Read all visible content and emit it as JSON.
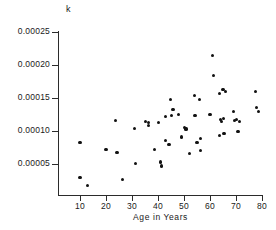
{
  "chart_data": {
    "type": "scatter",
    "title": "",
    "xlabel": "Age in Years",
    "ylabel": "k",
    "xlim": [
      0,
      82
    ],
    "ylim": [
      0,
      0.00025
    ],
    "grid": false,
    "legend": null,
    "xticks": [
      10,
      20,
      30,
      40,
      50,
      60,
      70,
      80
    ],
    "xtick_labels": [
      "10",
      "20",
      "30",
      "40",
      "50",
      "60",
      "70",
      "80"
    ],
    "yticks": [
      5e-05,
      0.0001,
      0.00015,
      0.0002,
      0.00025
    ],
    "ytick_labels": [
      "0.00005",
      "0.00010",
      "0.00015",
      "0.00020",
      "0.00025"
    ],
    "marker": "filled-circle",
    "marker_color": "#111111",
    "points": [
      {
        "x": 10.0,
        "y": 8.2e-05
      },
      {
        "x": 10.0,
        "y": 2.9e-05
      },
      {
        "x": 12.8,
        "y": 1.8e-05
      },
      {
        "x": 20.0,
        "y": 7.2e-05
      },
      {
        "x": 23.8,
        "y": 0.000116
      },
      {
        "x": 24.2,
        "y": 6.8e-05
      },
      {
        "x": 26.5,
        "y": 2.6e-05
      },
      {
        "x": 31.0,
        "y": 0.000104
      },
      {
        "x": 31.2,
        "y": 5.1e-05
      },
      {
        "x": 35.2,
        "y": 0.000114
      },
      {
        "x": 36.2,
        "y": 0.000113
      },
      {
        "x": 36.4,
        "y": 0.000108
      },
      {
        "x": 38.8,
        "y": 7.2e-05
      },
      {
        "x": 40.2,
        "y": 0.000113
      },
      {
        "x": 41.0,
        "y": 5.3e-05
      },
      {
        "x": 41.2,
        "y": 4.7e-05
      },
      {
        "x": 42.8,
        "y": 8.6e-05
      },
      {
        "x": 43.0,
        "y": 0.000122
      },
      {
        "x": 44.2,
        "y": 7.9e-05
      },
      {
        "x": 44.8,
        "y": 0.000148
      },
      {
        "x": 45.2,
        "y": 0.000123
      },
      {
        "x": 45.8,
        "y": 0.000133
      },
      {
        "x": 47.8,
        "y": 0.000125
      },
      {
        "x": 49.0,
        "y": 9.1e-05
      },
      {
        "x": 50.2,
        "y": 0.000105
      },
      {
        "x": 50.8,
        "y": 0.000103
      },
      {
        "x": 52.0,
        "y": 6.6e-05
      },
      {
        "x": 54.0,
        "y": 0.000154
      },
      {
        "x": 54.2,
        "y": 0.000123
      },
      {
        "x": 55.0,
        "y": 8.2e-05
      },
      {
        "x": 56.0,
        "y": 0.000148
      },
      {
        "x": 56.2,
        "y": 8.9e-05
      },
      {
        "x": 56.4,
        "y": 7e-05
      },
      {
        "x": 60.0,
        "y": 0.000125
      },
      {
        "x": 61.0,
        "y": 0.000215
      },
      {
        "x": 61.2,
        "y": 0.000184
      },
      {
        "x": 63.8,
        "y": 0.000157
      },
      {
        "x": 64.0,
        "y": 0.000118
      },
      {
        "x": 64.5,
        "y": 0.000114
      },
      {
        "x": 65.0,
        "y": 0.000163
      },
      {
        "x": 65.2,
        "y": 0.000119
      },
      {
        "x": 65.4,
        "y": 9.6e-05
      },
      {
        "x": 63.5,
        "y": 9.3e-05
      },
      {
        "x": 66.0,
        "y": 0.00016
      },
      {
        "x": 69.0,
        "y": 0.00013
      },
      {
        "x": 69.5,
        "y": 0.000116
      },
      {
        "x": 70.2,
        "y": 0.000117
      },
      {
        "x": 70.8,
        "y": 9.9e-05
      },
      {
        "x": 71.2,
        "y": 0.000115
      },
      {
        "x": 77.5,
        "y": 0.00016
      },
      {
        "x": 78.0,
        "y": 0.000136
      },
      {
        "x": 78.8,
        "y": 0.00013
      }
    ]
  }
}
